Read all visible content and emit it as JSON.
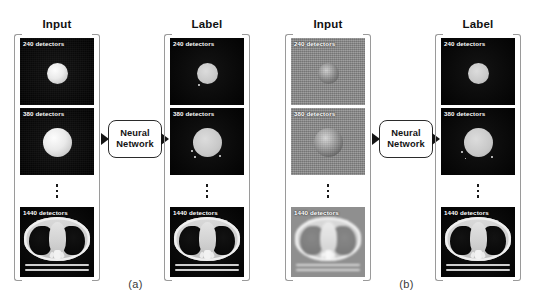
{
  "figure": {
    "subfigures": [
      {
        "caption": "(a)",
        "columns": [
          {
            "title": "Input",
            "tiles": [
              {
                "label": "240 detectors"
              },
              {
                "label": "380 detectors"
              },
              {
                "label": "1440 detectors"
              }
            ]
          },
          {
            "title": "Label",
            "tiles": [
              {
                "label": "240 detectors"
              },
              {
                "label": "380 detectors"
              },
              {
                "label": "1440 detectors"
              }
            ]
          }
        ],
        "processor": {
          "line1": "Neural",
          "line2": "Network"
        }
      },
      {
        "caption": "(b)",
        "columns": [
          {
            "title": "Input",
            "tiles": [
              {
                "label": "240 detectors"
              },
              {
                "label": "380 detectors"
              },
              {
                "label": "1440 detectors"
              }
            ]
          },
          {
            "title": "Label",
            "tiles": [
              {
                "label": "240 detectors"
              },
              {
                "label": "380 detectors"
              },
              {
                "label": "1440 detectors"
              }
            ]
          }
        ],
        "processor": {
          "line1": "Neural",
          "line2": "Network"
        }
      }
    ]
  }
}
